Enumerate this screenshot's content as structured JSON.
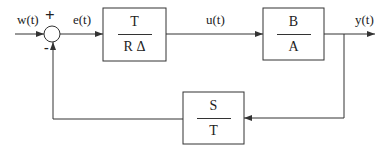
{
  "signals": {
    "input": "w(t)",
    "error": "e(t)",
    "control": "u(t)",
    "output": "y(t)"
  },
  "summing_junction": {
    "plus_sign": "+",
    "minus_sign": "-"
  },
  "blocks": {
    "controller": {
      "numerator": "T",
      "denominator": "R Δ"
    },
    "plant": {
      "numerator": "B",
      "denominator": "A"
    },
    "feedback": {
      "numerator": "S",
      "denominator": "T"
    }
  },
  "colors": {
    "line": "#333333",
    "text": "#222222",
    "background": "#ffffff"
  }
}
